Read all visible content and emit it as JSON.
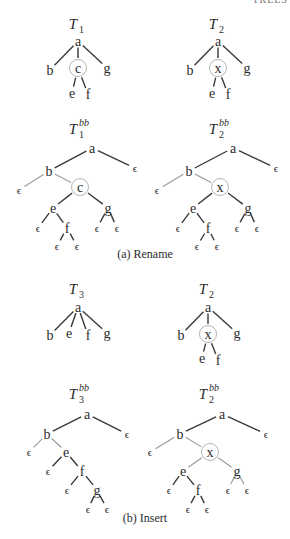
{
  "header_fragment": "TREES",
  "colors": {
    "text": "#2b2b2b",
    "edge_dark": "#3a3a3a",
    "edge_light": "#9a9a9a",
    "circle": "#b5b5b5"
  },
  "sections": [
    {
      "caption": "(a)  Rename",
      "caption_pos": [
        145,
        258
      ],
      "trees": [
        {
          "id": "T1",
          "label": "T",
          "sub": "1",
          "sup": "",
          "label_pos": [
            78,
            24
          ],
          "nodes": [
            {
              "id": "a",
              "text": "a",
              "x": 78,
              "y": 41
            },
            {
              "id": "b",
              "text": "b",
              "x": 50,
              "y": 70
            },
            {
              "id": "c",
              "text": "c",
              "x": 78,
              "y": 68,
              "circled": true
            },
            {
              "id": "g",
              "text": "g",
              "x": 107,
              "y": 68
            },
            {
              "id": "e",
              "text": "e",
              "x": 72,
              "y": 93
            },
            {
              "id": "f",
              "text": "f",
              "x": 88,
              "y": 94
            }
          ],
          "edges": [
            [
              "a",
              "b",
              "d"
            ],
            [
              "a",
              "c",
              "d"
            ],
            [
              "a",
              "g",
              "d"
            ],
            [
              "c",
              "e",
              "d"
            ],
            [
              "c",
              "f",
              "d"
            ]
          ]
        },
        {
          "id": "T2",
          "label": "T",
          "sub": "2",
          "sup": "",
          "label_pos": [
            218,
            24
          ],
          "nodes": [
            {
              "id": "a",
              "text": "a",
              "x": 218,
              "y": 41
            },
            {
              "id": "b",
              "text": "b",
              "x": 190,
              "y": 70
            },
            {
              "id": "x",
              "text": "x",
              "x": 218,
              "y": 68,
              "circled": true
            },
            {
              "id": "g",
              "text": "g",
              "x": 247,
              "y": 68
            },
            {
              "id": "e",
              "text": "e",
              "x": 212,
              "y": 93
            },
            {
              "id": "f",
              "text": "f",
              "x": 228,
              "y": 94
            }
          ],
          "edges": [
            [
              "a",
              "b",
              "d"
            ],
            [
              "a",
              "x",
              "d"
            ],
            [
              "a",
              "g",
              "d"
            ],
            [
              "x",
              "e",
              "d"
            ],
            [
              "x",
              "f",
              "d"
            ]
          ]
        },
        {
          "id": "T1bb",
          "label": "T",
          "sub": "1",
          "sup": "bb",
          "label_pos": [
            78,
            129
          ],
          "nodes": [
            {
              "id": "a",
              "text": "a",
              "x": 92,
              "y": 148
            },
            {
              "id": "eR",
              "text": "ϵ",
              "x": 135,
              "y": 168
            },
            {
              "id": "b",
              "text": "b",
              "x": 49,
              "y": 171
            },
            {
              "id": "eL",
              "text": "ϵ",
              "x": 19,
              "y": 190
            },
            {
              "id": "c",
              "text": "c",
              "x": 80,
              "y": 187,
              "circled": true
            },
            {
              "id": "e",
              "text": "e",
              "x": 53,
              "y": 208
            },
            {
              "id": "g",
              "text": "g",
              "x": 108,
              "y": 208
            },
            {
              "id": "e1",
              "text": "ϵ",
              "x": 38,
              "y": 228
            },
            {
              "id": "f",
              "text": "f",
              "x": 67,
              "y": 228
            },
            {
              "id": "g1",
              "text": "ϵ",
              "x": 97,
              "y": 228
            },
            {
              "id": "g2",
              "text": "ϵ",
              "x": 117,
              "y": 228
            },
            {
              "id": "f1",
              "text": "ϵ",
              "x": 57,
              "y": 246
            },
            {
              "id": "f2",
              "text": "ϵ",
              "x": 77,
              "y": 246
            }
          ],
          "edges": [
            [
              "a",
              "b",
              "d"
            ],
            [
              "a",
              "eR",
              "d"
            ],
            [
              "b",
              "eL",
              "l"
            ],
            [
              "b",
              "c",
              "l"
            ],
            [
              "c",
              "e",
              "d"
            ],
            [
              "c",
              "g",
              "d"
            ],
            [
              "e",
              "e1",
              "d"
            ],
            [
              "e",
              "f",
              "d"
            ],
            [
              "g",
              "g1",
              "d"
            ],
            [
              "g",
              "g2",
              "d"
            ],
            [
              "f",
              "f1",
              "d"
            ],
            [
              "f",
              "f2",
              "d"
            ]
          ]
        },
        {
          "id": "T2bb",
          "label": "T",
          "sub": "2",
          "sup": "bb",
          "label_pos": [
            218,
            129
          ],
          "nodes": [
            {
              "id": "a",
              "text": "a",
              "x": 233,
              "y": 148
            },
            {
              "id": "eR",
              "text": "ϵ",
              "x": 276,
              "y": 168
            },
            {
              "id": "b",
              "text": "b",
              "x": 189,
              "y": 171
            },
            {
              "id": "eL",
              "text": "ϵ",
              "x": 157,
              "y": 190
            },
            {
              "id": "x",
              "text": "x",
              "x": 220,
              "y": 187,
              "circled": true
            },
            {
              "id": "e",
              "text": "e",
              "x": 193,
              "y": 208
            },
            {
              "id": "g",
              "text": "g",
              "x": 248,
              "y": 208
            },
            {
              "id": "e1",
              "text": "ϵ",
              "x": 178,
              "y": 228
            },
            {
              "id": "f",
              "text": "f",
              "x": 208,
              "y": 228
            },
            {
              "id": "g1",
              "text": "ϵ",
              "x": 237,
              "y": 228
            },
            {
              "id": "g2",
              "text": "ϵ",
              "x": 257,
              "y": 228
            },
            {
              "id": "f1",
              "text": "ϵ",
              "x": 197,
              "y": 246
            },
            {
              "id": "f2",
              "text": "ϵ",
              "x": 217,
              "y": 246
            }
          ],
          "edges": [
            [
              "a",
              "b",
              "d"
            ],
            [
              "a",
              "eR",
              "d"
            ],
            [
              "b",
              "eL",
              "l"
            ],
            [
              "b",
              "x",
              "l"
            ],
            [
              "x",
              "e",
              "d"
            ],
            [
              "x",
              "g",
              "d"
            ],
            [
              "e",
              "e1",
              "d"
            ],
            [
              "e",
              "f",
              "d"
            ],
            [
              "g",
              "g1",
              "d"
            ],
            [
              "g",
              "g2",
              "d"
            ],
            [
              "f",
              "f1",
              "d"
            ],
            [
              "f",
              "f2",
              "d"
            ]
          ]
        }
      ]
    },
    {
      "caption": "(b)  Insert",
      "caption_pos": [
        145,
        522
      ],
      "trees": [
        {
          "id": "T3",
          "label": "T",
          "sub": "3",
          "sup": "",
          "label_pos": [
            78,
            289
          ],
          "nodes": [
            {
              "id": "a",
              "text": "a",
              "x": 78,
              "y": 307
            },
            {
              "id": "b",
              "text": "b",
              "x": 50,
              "y": 335
            },
            {
              "id": "e",
              "text": "e",
              "x": 69,
              "y": 333
            },
            {
              "id": "f",
              "text": "f",
              "x": 88,
              "y": 335
            },
            {
              "id": "g",
              "text": "g",
              "x": 107,
              "y": 333
            }
          ],
          "edges": [
            [
              "a",
              "b",
              "d"
            ],
            [
              "a",
              "e",
              "d"
            ],
            [
              "a",
              "f",
              "d"
            ],
            [
              "a",
              "g",
              "d"
            ]
          ]
        },
        {
          "id": "T2i",
          "label": "T",
          "sub": "2",
          "sup": "",
          "label_pos": [
            208,
            289
          ],
          "nodes": [
            {
              "id": "a",
              "text": "a",
              "x": 208,
              "y": 307
            },
            {
              "id": "b",
              "text": "b",
              "x": 181,
              "y": 335
            },
            {
              "id": "x",
              "text": "x",
              "x": 208,
              "y": 334,
              "circled": true
            },
            {
              "id": "g",
              "text": "g",
              "x": 237,
              "y": 333
            },
            {
              "id": "e",
              "text": "e",
              "x": 202,
              "y": 358
            },
            {
              "id": "f",
              "text": "f",
              "x": 218,
              "y": 360
            }
          ],
          "edges": [
            [
              "a",
              "b",
              "d"
            ],
            [
              "a",
              "x",
              "d"
            ],
            [
              "a",
              "g",
              "d"
            ],
            [
              "x",
              "e",
              "d"
            ],
            [
              "x",
              "f",
              "d"
            ]
          ]
        },
        {
          "id": "T3bb",
          "label": "T",
          "sub": "3",
          "sup": "bb",
          "label_pos": [
            78,
            394
          ],
          "nodes": [
            {
              "id": "a",
              "text": "a",
              "x": 87,
              "y": 414
            },
            {
              "id": "eR",
              "text": "ϵ",
              "x": 127,
              "y": 434
            },
            {
              "id": "b",
              "text": "b",
              "x": 47,
              "y": 434
            },
            {
              "id": "bL",
              "text": "ϵ",
              "x": 29,
              "y": 452
            },
            {
              "id": "e",
              "text": "e",
              "x": 66,
              "y": 452
            },
            {
              "id": "eL",
              "text": "ϵ",
              "x": 48,
              "y": 471
            },
            {
              "id": "f",
              "text": "f",
              "x": 82,
              "y": 471
            },
            {
              "id": "fL",
              "text": "ϵ",
              "x": 67,
              "y": 490
            },
            {
              "id": "g",
              "text": "g",
              "x": 97,
              "y": 490
            },
            {
              "id": "g1",
              "text": "ϵ",
              "x": 88,
              "y": 509
            },
            {
              "id": "g2",
              "text": "ϵ",
              "x": 107,
              "y": 509
            }
          ],
          "edges": [
            [
              "a",
              "b",
              "d"
            ],
            [
              "a",
              "eR",
              "d"
            ],
            [
              "b",
              "bL",
              "l"
            ],
            [
              "b",
              "e",
              "l"
            ],
            [
              "e",
              "eL",
              "d"
            ],
            [
              "e",
              "f",
              "d"
            ],
            [
              "f",
              "fL",
              "d"
            ],
            [
              "f",
              "g",
              "d"
            ],
            [
              "g",
              "g1",
              "d"
            ],
            [
              "g",
              "g2",
              "d"
            ]
          ]
        },
        {
          "id": "T2bb_i",
          "label": "T",
          "sub": "2",
          "sup": "bb",
          "label_pos": [
            208,
            394
          ],
          "nodes": [
            {
              "id": "a",
              "text": "a",
              "x": 222,
              "y": 414
            },
            {
              "id": "eR",
              "text": "ϵ",
              "x": 266,
              "y": 434
            },
            {
              "id": "b",
              "text": "b",
              "x": 180,
              "y": 434
            },
            {
              "id": "eL",
              "text": "ϵ",
              "x": 150,
              "y": 452
            },
            {
              "id": "x",
              "text": "x",
              "x": 210,
              "y": 452,
              "circled": true
            },
            {
              "id": "e",
              "text": "e",
              "x": 183,
              "y": 471
            },
            {
              "id": "g",
              "text": "g",
              "x": 237,
              "y": 471
            },
            {
              "id": "e1",
              "text": "ϵ",
              "x": 169,
              "y": 490
            },
            {
              "id": "f",
              "text": "f",
              "x": 198,
              "y": 490
            },
            {
              "id": "g1",
              "text": "ϵ",
              "x": 228,
              "y": 490
            },
            {
              "id": "g2",
              "text": "ϵ",
              "x": 247,
              "y": 490
            },
            {
              "id": "f1",
              "text": "ϵ",
              "x": 188,
              "y": 509
            },
            {
              "id": "f2",
              "text": "ϵ",
              "x": 207,
              "y": 509
            }
          ],
          "edges": [
            [
              "a",
              "b",
              "d"
            ],
            [
              "a",
              "eR",
              "d"
            ],
            [
              "b",
              "eL",
              "l"
            ],
            [
              "b",
              "x",
              "l"
            ],
            [
              "x",
              "e",
              "l"
            ],
            [
              "x",
              "g",
              "l"
            ],
            [
              "e",
              "e1",
              "d"
            ],
            [
              "e",
              "f",
              "d"
            ],
            [
              "g",
              "g1",
              "l"
            ],
            [
              "g",
              "g2",
              "l"
            ],
            [
              "f",
              "f1",
              "d"
            ],
            [
              "f",
              "f2",
              "d"
            ]
          ]
        }
      ]
    }
  ]
}
